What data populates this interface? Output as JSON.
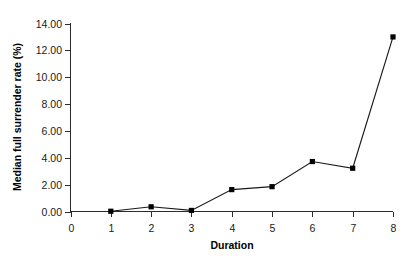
{
  "chart_data": {
    "type": "line",
    "title": "",
    "xlabel": "Duration",
    "ylabel": "Median full surrender rate (%)",
    "x": [
      1,
      2,
      3,
      4,
      5,
      6,
      7,
      8
    ],
    "values": [
      0.02,
      0.35,
      0.08,
      1.63,
      1.85,
      3.72,
      3.22,
      13.0
    ],
    "series": [
      {
        "name": "Median full surrender rate",
        "values": [
          0.02,
          0.35,
          0.08,
          1.63,
          1.85,
          3.72,
          3.22,
          13.0
        ]
      }
    ],
    "xlim": [
      0,
      8
    ],
    "ylim": [
      0,
      14
    ],
    "xticks": [
      0,
      1,
      2,
      3,
      4,
      5,
      6,
      7,
      8
    ],
    "xtick_labels": [
      "0",
      "1",
      "2",
      "3",
      "4",
      "5",
      "6",
      "7",
      "8"
    ],
    "yticks": [
      0,
      2,
      4,
      6,
      8,
      10,
      12,
      14
    ],
    "ytick_labels": [
      "0.00",
      "2.00",
      "4.00",
      "6.00",
      "8.00",
      "10.00",
      "12.00",
      "14.00"
    ],
    "grid": false,
    "legend": false,
    "legend_position": "none",
    "marker": "square",
    "line_color": "#1a1a1a",
    "marker_color": "#000000",
    "background_color": "#ffffff",
    "annotations": []
  }
}
